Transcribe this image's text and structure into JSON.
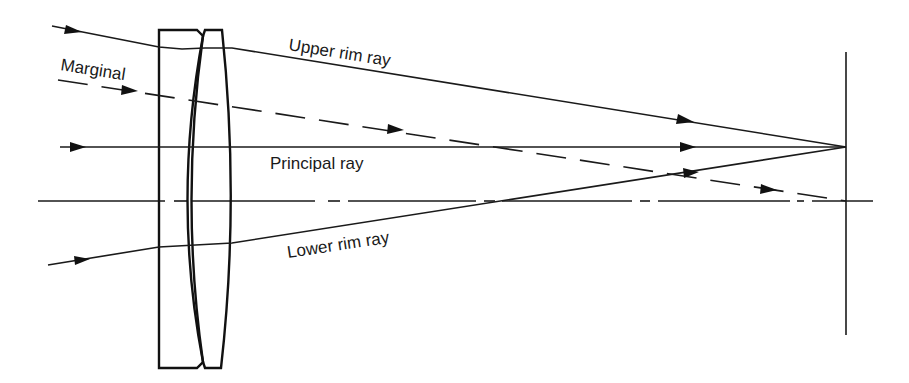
{
  "figure": {
    "labels": {
      "upper_rim_ray": "Upper rim ray",
      "marginal": "Marginal",
      "principal_ray": "Principal ray",
      "lower_rim_ray": "Lower rim ray"
    },
    "colors": {
      "line": "#1a1a1a",
      "background": "#ffffff"
    },
    "elements": {
      "optical_axis": "dash-dot line",
      "lens": "cemented doublet",
      "image_plane": "vertical line"
    }
  }
}
